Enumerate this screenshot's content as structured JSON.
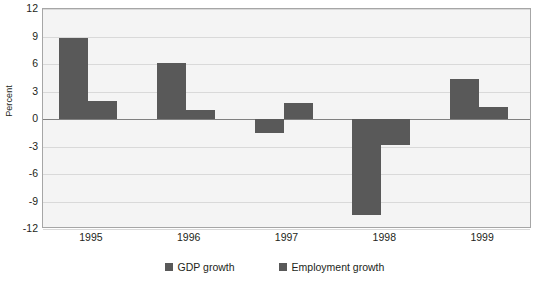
{
  "chart_data": {
    "type": "bar",
    "title": "",
    "subtitle": "",
    "xlabel": "",
    "ylabel": "Percent",
    "categories": [
      "1995",
      "1996",
      "1997",
      "1998",
      "1999"
    ],
    "series": [
      {
        "name": "GDP growth",
        "color": "#595959",
        "values": [
          8.8,
          6.1,
          -1.5,
          -10.5,
          4.4
        ]
      },
      {
        "name": "Employment growth",
        "color": "#595959",
        "values": [
          2.0,
          1.0,
          1.8,
          -2.8,
          1.3
        ]
      }
    ],
    "ylim": [
      -12,
      12
    ],
    "yticks": [
      12,
      9,
      6,
      3,
      0,
      -3,
      -6,
      -9,
      -12
    ],
    "ytick_labels": [
      "12",
      "9",
      "6",
      "3",
      "0",
      "-3",
      "-6",
      "-9",
      "-12"
    ],
    "grid": true,
    "grid_axis": "y",
    "legend_position": "bottom",
    "plot_background": "#f4f4f4",
    "axis_color": "#a6a6a6",
    "zero_line_color": "#808080"
  },
  "legend": {
    "items": [
      {
        "label": "GDP growth"
      },
      {
        "label": "Employment growth"
      }
    ]
  }
}
